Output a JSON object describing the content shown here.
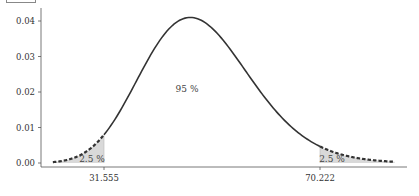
{
  "header": {
    "cutoff_text": "partially visible text (cut off)"
  },
  "chart_data": {
    "type": "area",
    "title": "",
    "distribution": "chi-square",
    "degrees_of_freedom": 49,
    "xlabel": "",
    "ylabel": "",
    "ylim": [
      0,
      0.04
    ],
    "yticks": [
      "0.00",
      "0.01",
      "0.02",
      "0.03",
      "0.04"
    ],
    "xticks": [
      "31.555",
      "70.222"
    ],
    "x_range": [
      22.4,
      83.6
    ],
    "critical_values": {
      "lower": 31.555,
      "upper": 70.222
    },
    "regions": [
      {
        "name": "left tail",
        "label": "2.5 %",
        "shaded": true,
        "line": "dashed"
      },
      {
        "name": "center",
        "label": "95 %",
        "shaded": false,
        "line": "solid"
      },
      {
        "name": "right tail",
        "label": "2.5 %",
        "shaded": true,
        "line": "dashed"
      }
    ],
    "peak": {
      "x": 47,
      "y": 0.0403
    },
    "grid": false,
    "legend": "none",
    "colors": {
      "curve": "#333333",
      "shade": "#d9d9d9",
      "axis": "#555555"
    }
  },
  "labels": {
    "center_pct": "95 %",
    "left_pct": "2.5 %",
    "right_pct": "2.5 %",
    "lower_cut": "31.555",
    "upper_cut": "70.222",
    "y0": "0.00",
    "y1": "0.01",
    "y2": "0.02",
    "y3": "0.03",
    "y4": "0.04"
  }
}
